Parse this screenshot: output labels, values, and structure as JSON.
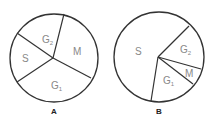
{
  "diagrams": [
    {
      "caption": "A",
      "center": [
        54,
        58
      ],
      "radius": 44,
      "pivot": [
        53,
        58
      ],
      "boundaries": [
        [
          64,
          14
        ],
        [
          17,
          33
        ],
        [
          17,
          82
        ],
        [
          91,
          78
        ]
      ],
      "labels": [
        {
          "text": "G",
          "sub": "2",
          "x": 42,
          "y": 43
        },
        {
          "text": "M",
          "sub": "",
          "x": 73,
          "y": 55
        },
        {
          "text": "S",
          "sub": "",
          "x": 22,
          "y": 62
        },
        {
          "text": "G",
          "sub": "1",
          "x": 51,
          "y": 89
        }
      ]
    },
    {
      "caption": "B",
      "center": [
        159,
        57
      ],
      "radius": 45,
      "pivot": [
        158,
        57
      ],
      "boundaries": [
        [
          189,
          26
        ],
        [
          201,
          69
        ],
        [
          193,
          84
        ],
        [
          151,
          101
        ]
      ],
      "labels": [
        {
          "text": "S",
          "sub": "",
          "x": 135,
          "y": 55
        },
        {
          "text": "G",
          "sub": "2",
          "x": 180,
          "y": 53
        },
        {
          "text": "M",
          "sub": "",
          "x": 185,
          "y": 77
        },
        {
          "text": "G",
          "sub": "1",
          "x": 163,
          "y": 84
        }
      ]
    }
  ]
}
